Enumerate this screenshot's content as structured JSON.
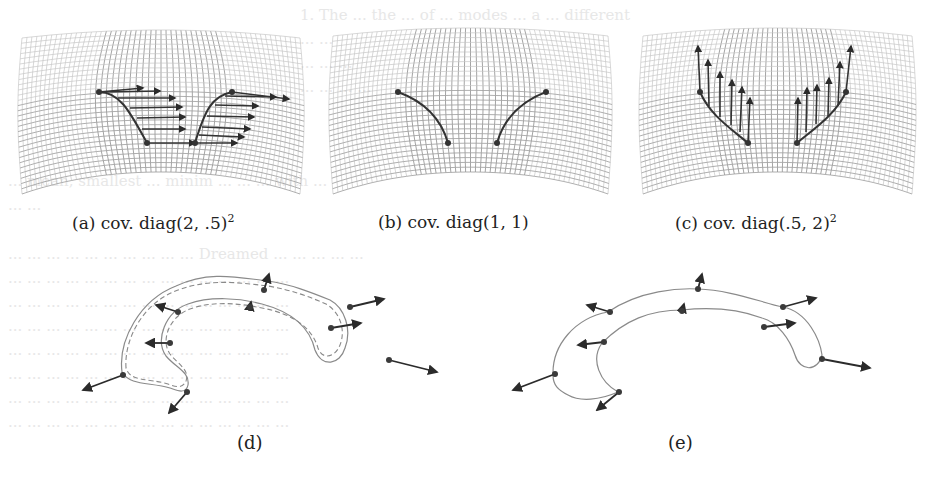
{
  "figure": {
    "subfigures": [
      {
        "id": "a",
        "label": "(a)",
        "caption": "cov. diag(2, .5)",
        "superscript": "2",
        "arrow_direction": "horizontal-right"
      },
      {
        "id": "b",
        "label": "(b)",
        "caption": "cov. diag(1, 1)",
        "superscript": "",
        "arrow_direction": "none"
      },
      {
        "id": "c",
        "label": "(c)",
        "caption": "cov. diag(.5, 2)",
        "superscript": "2",
        "arrow_direction": "vertical-up"
      },
      {
        "id": "d",
        "label": "(d)",
        "caption": "",
        "superscript": ""
      },
      {
        "id": "e",
        "label": "(e)",
        "caption": "",
        "superscript": ""
      }
    ]
  },
  "bleed_through": [
    "1. The ... the ... of ... modes ... a ... different",
    "... ...",
    "... ... ...",
    "... ... ... ...",
    "... mean, smallest ... minim ... ... ... with ...",
    "... ...",
    "... ... ... ... ... ... ... ... ... ... Dreamed ... ... ... ... ...",
    "... ... ... ... ... ... ... ... ... ... ... ... ... ... ...",
    "... ... ... ... ... ... ... ... ... ... ... ... ... ... ...",
    "... ... ... ... ... ... ... ... ... ... ... ... ... ... ...",
    "... ... ... ... ... ... ... ... ... ... ... ... ... ... ...",
    "... ... ... ... ... ... ... ... ... ... ... ... ... ... ...",
    "... ... ... ... ... ... ... ... ... ... ... ... ... ... ...",
    "... ... ... ... ... ... ... ... ... ... ... ... ... ... ..."
  ],
  "colors": {
    "grid": "#9a9a9a",
    "grid_dense": "#bdbdbd",
    "curve": "#3a3a3a",
    "arrow": "#2b2b2b",
    "outline": "#8a8a8a"
  }
}
